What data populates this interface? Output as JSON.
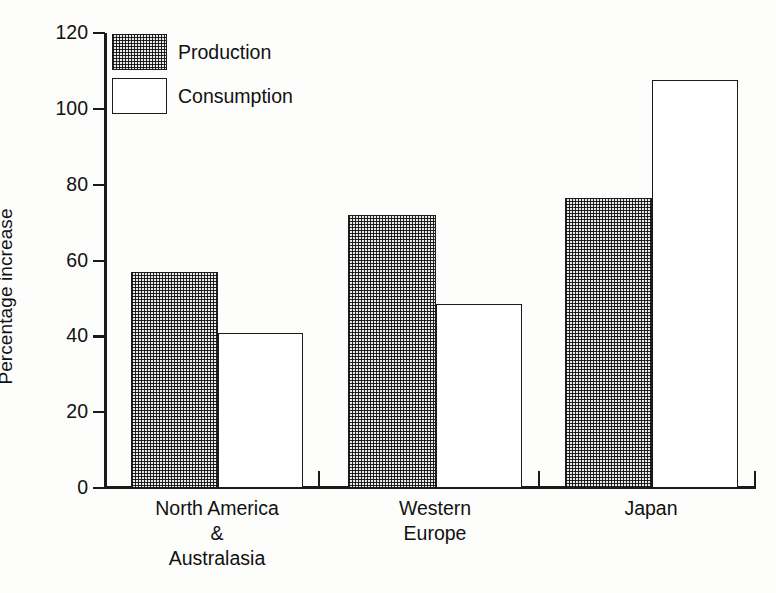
{
  "chart_data": {
    "type": "bar",
    "title": "",
    "xlabel": "",
    "ylabel": "Percentage increase",
    "ylim": [
      0,
      120
    ],
    "yticks": [
      0,
      20,
      40,
      60,
      80,
      100,
      120
    ],
    "ytick_labels": [
      "0",
      "20",
      "40",
      "60",
      "80",
      "100",
      "120"
    ],
    "grid": false,
    "legend_position": "top-left",
    "categories": [
      "North America\n&\nAustralasia",
      "Western\nEurope",
      "Japan"
    ],
    "category_lines": [
      [
        "North America",
        "&",
        "Australasia"
      ],
      [
        "Western",
        "Europe"
      ],
      [
        "Japan"
      ]
    ],
    "series": [
      {
        "name": "Production",
        "values": [
          57,
          72,
          76.5
        ]
      },
      {
        "name": "Consumption",
        "values": [
          41,
          48.5,
          107.5
        ]
      }
    ]
  },
  "legend": {
    "items": [
      {
        "label": "Production",
        "fill": "dotted"
      },
      {
        "label": "Consumption",
        "fill": "white"
      }
    ]
  },
  "axes": {
    "y_label": "Percentage increase",
    "y_ticks": [
      "120",
      "100",
      "80",
      "60",
      "40",
      "20",
      "0"
    ]
  },
  "colors": {
    "ink": "#1a1a1a",
    "paper": "#fdfdfc",
    "pattern_fill": "#e8e8e8"
  }
}
